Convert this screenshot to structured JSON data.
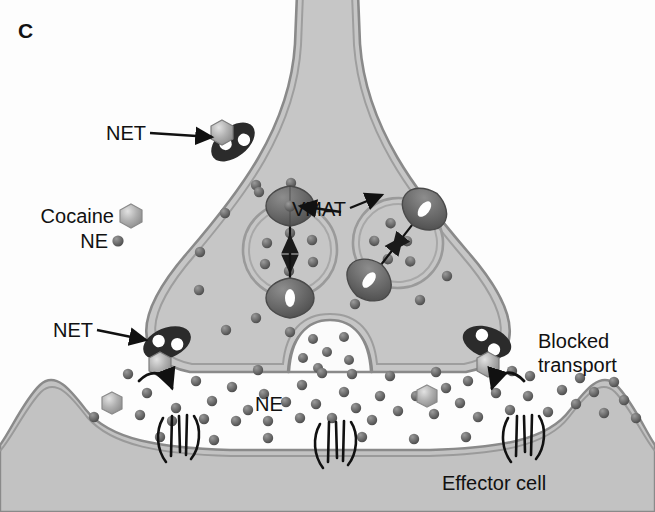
{
  "figure": {
    "panel_label": "C"
  },
  "labels": {
    "net_upper": "NET",
    "net_lower": "NET",
    "vmat": "VMAT",
    "blocked_transport_line1": "Blocked",
    "blocked_transport_line2": "transport",
    "ne_cleft": "NE",
    "effector_cell": "Effector cell"
  },
  "legend": {
    "items": [
      {
        "label": "Cocaine",
        "glyph": "hexagon",
        "color": "#a8a8a8"
      },
      {
        "label": "NE",
        "glyph": "dot",
        "color": "#6e6e6e"
      }
    ]
  },
  "colors": {
    "background": "#fdfdfd",
    "cytoplasm": "#c6c6c6",
    "membrane_line": "#8a8a8a",
    "membrane_fill": "#d6d6d6",
    "cleft": "#fbfbfb",
    "effector_fill": "#c2c2c2",
    "transporter_dark": "#2b2b2b",
    "transporter_white": "#ffffff",
    "vmat_body": "#6e6e6e",
    "ne_dot": "#6e6e6e",
    "cocaine_hex": "#a8a8a8",
    "receptor_stroke": "#111111",
    "text": "#111111"
  },
  "structures": {
    "axon_terminal": {
      "name": "presynaptic axon terminal",
      "shape": "bell"
    },
    "vesicles": [
      {
        "id": "vesicle-left",
        "cx": 290,
        "cy": 240,
        "r": 46,
        "rotation": 0,
        "ne_count": 6,
        "vmat_count": 2
      },
      {
        "id": "vesicle-right",
        "cx": 395,
        "cy": 228,
        "r": 44,
        "rotation": 40,
        "ne_count": 5,
        "vmat_count": 2
      }
    ],
    "exocytosis_vesicle": {
      "id": "vesicle-fusing",
      "cx": 328,
      "cy": 345,
      "ne_count": 6
    },
    "transporters": [
      {
        "id": "net-upper",
        "cx": 231,
        "cy": 141,
        "rotation": -40,
        "cocaine_bound": true,
        "blocked": true
      },
      {
        "id": "net-left",
        "cx": 166,
        "cy": 346,
        "rotation": -22,
        "cocaine_bound": true,
        "blocked": true
      },
      {
        "id": "net-right",
        "cx": 486,
        "cy": 345,
        "rotation": 18,
        "cocaine_bound": true,
        "blocked": true
      }
    ],
    "receptors": [
      {
        "id": "gpcr-left",
        "cx": 180,
        "cy": 437
      },
      {
        "id": "gpcr-center",
        "cx": 337,
        "cy": 443
      },
      {
        "id": "gpcr-right",
        "cx": 525,
        "cy": 437
      }
    ]
  },
  "particles": {
    "cytoplasm_ne": [
      [
        256,
        185
      ],
      [
        225,
        213
      ],
      [
        200,
        252
      ],
      [
        199,
        290
      ],
      [
        256,
        318
      ],
      [
        258,
        250
      ],
      [
        285,
        227
      ],
      [
        289,
        271
      ],
      [
        312,
        258
      ],
      [
        268,
        278
      ],
      [
        375,
        220
      ],
      [
        385,
        240
      ],
      [
        405,
        235
      ],
      [
        393,
        255
      ],
      [
        414,
        218
      ]
    ],
    "cleft_ne": [
      [
        128,
        374
      ],
      [
        196,
        381
      ],
      [
        110,
        399
      ],
      [
        147,
        393
      ],
      [
        176,
        408
      ],
      [
        212,
        401
      ],
      [
        232,
        387
      ],
      [
        248,
        410
      ],
      [
        264,
        394
      ],
      [
        140,
        415
      ],
      [
        172,
        421
      ],
      [
        204,
        419
      ],
      [
        236,
        421
      ],
      [
        268,
        421
      ],
      [
        286,
        402
      ],
      [
        302,
        385
      ],
      [
        316,
        404
      ],
      [
        300,
        418
      ],
      [
        332,
        418
      ],
      [
        322,
        373
      ],
      [
        344,
        392
      ],
      [
        356,
        408
      ],
      [
        372,
        420
      ],
      [
        352,
        374
      ],
      [
        380,
        396
      ],
      [
        398,
        411
      ],
      [
        416,
        396
      ],
      [
        434,
        414
      ],
      [
        390,
        376
      ],
      [
        446,
        388
      ],
      [
        460,
        403
      ],
      [
        478,
        417
      ],
      [
        468,
        381
      ],
      [
        496,
        393
      ],
      [
        510,
        410
      ],
      [
        528,
        396
      ],
      [
        548,
        412
      ],
      [
        530,
        376
      ],
      [
        562,
        390
      ],
      [
        576,
        404
      ],
      [
        594,
        392
      ],
      [
        604,
        413
      ],
      [
        580,
        378
      ],
      [
        624,
        400
      ],
      [
        614,
        382
      ],
      [
        94,
        417
      ],
      [
        636,
        418
      ],
      [
        258,
        370
      ],
      [
        436,
        372
      ],
      [
        512,
        371
      ],
      [
        160,
        437
      ],
      [
        214,
        440
      ],
      [
        268,
        438
      ],
      [
        362,
        437
      ],
      [
        414,
        439
      ],
      [
        466,
        437
      ]
    ],
    "cleft_cocaine": [
      [
        112,
        403
      ],
      [
        427,
        396
      ]
    ]
  },
  "arrows": {
    "vmat_left_down": {
      "from": [
        290,
        196
      ],
      "to": [
        290,
        268
      ]
    },
    "vmat_left_up": {
      "from": [
        290,
        312
      ],
      "to": [
        290,
        250
      ]
    },
    "vmat_right_in": {
      "from": [
        362,
        228
      ],
      "to": [
        398,
        252
      ]
    },
    "vmat_right_in2": {
      "from": [
        434,
        268
      ],
      "to": [
        400,
        244
      ]
    },
    "net_left_curve": {
      "label": "blocked reuptake left"
    },
    "net_right_curve": {
      "label": "blocked reuptake right"
    }
  }
}
